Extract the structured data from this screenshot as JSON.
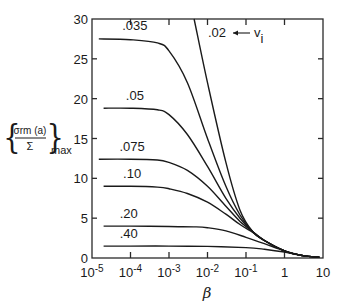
{
  "chart_data": {
    "type": "line",
    "title": "",
    "xlabel": "β",
    "ylabel": "{σrm(a)/Σ}max",
    "ylabel_parts": {
      "numerator": "σrm (a)",
      "denominator": "Σ",
      "subscript": "max"
    },
    "xscale": "log",
    "xlim": [
      1e-05,
      10
    ],
    "ylim": [
      0,
      30
    ],
    "grid": false,
    "legend": "none (inline curve labels)",
    "x_ticks": [
      {
        "value": 1e-05,
        "base": "10",
        "exp": "-5"
      },
      {
        "value": 0.0001,
        "base": "10",
        "exp": "-4"
      },
      {
        "value": 0.001,
        "base": "10",
        "exp": "-3"
      },
      {
        "value": 0.01,
        "base": "10",
        "exp": "-2"
      },
      {
        "value": 0.1,
        "base": "10",
        "exp": "-1"
      },
      {
        "value": 1,
        "base": "1",
        "exp": ""
      },
      {
        "value": 10,
        "base": "10",
        "exp": ""
      }
    ],
    "y_ticks": [
      0,
      5,
      10,
      15,
      20,
      25,
      30
    ],
    "annotation": {
      "text": ".02",
      "arrow_to": "v",
      "subscript": "i",
      "meaning": "curves parameterized by v_i"
    },
    "series": [
      {
        "name": ".02",
        "label": ".02",
        "x": [
          0.0045,
          0.01,
          0.03,
          0.07,
          0.15,
          0.3,
          1,
          3,
          8
        ],
        "y": [
          30,
          22,
          12,
          6,
          3.3,
          2.2,
          0.9,
          0.3,
          0.1
        ]
      },
      {
        "name": ".035",
        "label": ".035",
        "x": [
          1.5e-05,
          0.0001,
          0.0005,
          0.001,
          0.003,
          0.01,
          0.03,
          0.07,
          0.15,
          0.3,
          1,
          3,
          8
        ],
        "y": [
          27.5,
          27.4,
          27,
          26,
          22,
          15,
          9,
          5.4,
          3.3,
          2.2,
          0.9,
          0.3,
          0.1
        ]
      },
      {
        "name": ".05",
        "label": ".05",
        "x": [
          2e-05,
          0.0001,
          0.0005,
          0.001,
          0.003,
          0.01,
          0.03,
          0.07,
          0.15,
          0.3,
          1,
          3,
          8
        ],
        "y": [
          18.8,
          18.8,
          18.6,
          18,
          15.5,
          11.5,
          7.5,
          5,
          3.3,
          2.2,
          0.9,
          0.3,
          0.1
        ]
      },
      {
        "name": ".075",
        "label": ".075",
        "x": [
          1.5e-05,
          0.0001,
          0.0005,
          0.001,
          0.003,
          0.01,
          0.03,
          0.07,
          0.15,
          0.3,
          1,
          3,
          8
        ],
        "y": [
          12.4,
          12.4,
          12.3,
          12,
          11,
          9,
          6.5,
          4.6,
          3.3,
          2.2,
          0.9,
          0.3,
          0.1
        ]
      },
      {
        "name": ".10",
        "label": ".10",
        "x": [
          2e-05,
          0.0001,
          0.0005,
          0.001,
          0.003,
          0.01,
          0.03,
          0.07,
          0.15,
          0.3,
          1,
          3,
          8
        ],
        "y": [
          9.0,
          9.0,
          8.9,
          8.7,
          8.1,
          7,
          5.5,
          4.2,
          3.2,
          2.2,
          0.9,
          0.3,
          0.1
        ]
      },
      {
        "name": ".20",
        "label": ".20",
        "x": [
          2e-05,
          0.0001,
          0.001,
          0.005,
          0.01,
          0.03,
          0.1,
          0.3,
          1,
          3,
          8
        ],
        "y": [
          4.0,
          4.0,
          3.95,
          3.9,
          3.8,
          3.4,
          2.6,
          1.8,
          0.9,
          0.3,
          0.1
        ]
      },
      {
        "name": ".40",
        "label": ".40",
        "x": [
          2e-05,
          0.0001,
          0.001,
          0.01,
          0.1,
          0.3,
          1,
          3,
          8
        ],
        "y": [
          1.5,
          1.5,
          1.5,
          1.45,
          1.3,
          1.1,
          0.75,
          0.3,
          0.1
        ]
      }
    ],
    "label_positions": [
      {
        "series": ".035",
        "x": 0.00013,
        "y": 28.6
      },
      {
        "series": ".05",
        "x": 0.00013,
        "y": 19.8
      },
      {
        "series": ".075",
        "x": 0.00011,
        "y": 13.4
      },
      {
        "series": ".10",
        "x": 0.00011,
        "y": 10.0
      },
      {
        "series": ".20",
        "x": 9e-05,
        "y": 5.0
      },
      {
        "series": ".40",
        "x": 9e-05,
        "y": 2.5
      }
    ]
  }
}
